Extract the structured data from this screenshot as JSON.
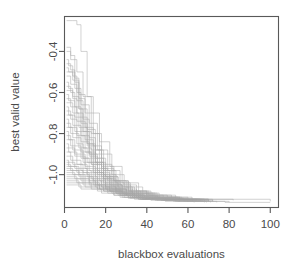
{
  "chart_data": {
    "type": "line",
    "title": "",
    "subtitle": "",
    "xlabel": "blackbox evaluations",
    "ylabel": "best valid value",
    "xlim": [
      0,
      104
    ],
    "ylim": [
      -1.16,
      -0.23
    ],
    "grid": false,
    "legend": false,
    "legend_position": "none",
    "line_color": "#a9a9a9",
    "axis_color": "#595959",
    "background_color": "#ffffff",
    "box_type": "full-rectangle",
    "step_type": "hv",
    "xticks": [
      0,
      20,
      40,
      60,
      80,
      100
    ],
    "xticklabels": [
      "0",
      "20",
      "40",
      "60",
      "80",
      "100"
    ],
    "yticks": [
      -0.4,
      -0.6,
      -0.8,
      -1.0
    ],
    "yticklabels": [
      "-0.4",
      "-0.6",
      "-0.8",
      "-1.0"
    ],
    "n_series": 40,
    "series": [
      {
        "name": "run-01",
        "x": [
          1,
          4,
          6,
          8,
          11,
          14,
          18,
          23,
          30,
          40,
          55,
          70
        ],
        "y": [
          -0.25,
          -0.25,
          -0.27,
          -0.4,
          -0.62,
          -0.8,
          -0.95,
          -1.03,
          -1.08,
          -1.11,
          -1.12,
          -1.125
        ]
      },
      {
        "name": "run-02",
        "x": [
          1,
          3,
          5,
          7,
          9,
          12,
          16,
          20,
          26,
          34,
          48,
          66
        ],
        "y": [
          -0.38,
          -0.42,
          -0.55,
          -0.68,
          -0.79,
          -0.9,
          -1.0,
          -1.06,
          -1.09,
          -1.11,
          -1.12,
          -1.13
        ]
      },
      {
        "name": "run-03",
        "x": [
          1,
          3,
          6,
          9,
          13,
          17,
          22,
          28,
          36,
          46,
          60,
          82
        ],
        "y": [
          -0.4,
          -0.44,
          -0.5,
          -0.62,
          -0.7,
          -0.84,
          -0.96,
          -1.04,
          -1.09,
          -1.11,
          -1.12,
          -1.125
        ]
      },
      {
        "name": "run-04",
        "x": [
          1,
          2,
          4,
          6,
          8,
          11,
          15,
          19,
          25,
          33,
          44,
          58,
          100
        ],
        "y": [
          -0.44,
          -0.47,
          -0.52,
          -0.6,
          -0.72,
          -0.85,
          -0.94,
          -1.02,
          -1.07,
          -1.1,
          -1.115,
          -1.12,
          -1.13
        ]
      },
      {
        "name": "run-05",
        "x": [
          1,
          3,
          5,
          8,
          12,
          16,
          21,
          27,
          35,
          45,
          62
        ],
        "y": [
          -0.46,
          -0.49,
          -0.58,
          -0.66,
          -0.75,
          -0.88,
          -0.98,
          -1.05,
          -1.09,
          -1.11,
          -1.125
        ]
      },
      {
        "name": "run-06",
        "x": [
          1,
          2,
          5,
          7,
          10,
          14,
          18,
          24,
          31,
          41,
          54,
          70
        ],
        "y": [
          -0.48,
          -0.5,
          -0.53,
          -0.63,
          -0.77,
          -0.86,
          -0.97,
          -1.03,
          -1.08,
          -1.1,
          -1.12,
          -1.13
        ]
      },
      {
        "name": "run-07",
        "x": [
          1,
          4,
          7,
          10,
          13,
          17,
          23,
          29,
          38,
          50,
          66
        ],
        "y": [
          -0.5,
          -0.54,
          -0.61,
          -0.7,
          -0.8,
          -0.9,
          -1.0,
          -1.06,
          -1.1,
          -1.12,
          -1.125
        ]
      },
      {
        "name": "run-08",
        "x": [
          1,
          3,
          6,
          9,
          12,
          15,
          20,
          26,
          34,
          44,
          57,
          72
        ],
        "y": [
          -0.52,
          -0.56,
          -0.64,
          -0.73,
          -0.82,
          -0.92,
          -1.01,
          -1.06,
          -1.09,
          -1.11,
          -1.12,
          -1.13
        ]
      },
      {
        "name": "run-09",
        "x": [
          1,
          2,
          4,
          7,
          11,
          15,
          19,
          25,
          32,
          42,
          56
        ],
        "y": [
          -0.55,
          -0.58,
          -0.62,
          -0.68,
          -0.78,
          -0.88,
          -0.98,
          -1.04,
          -1.08,
          -1.11,
          -1.12
        ]
      },
      {
        "name": "run-10",
        "x": [
          1,
          3,
          5,
          8,
          11,
          14,
          19,
          24,
          30,
          39,
          52,
          68
        ],
        "y": [
          -0.57,
          -0.6,
          -0.67,
          -0.75,
          -0.85,
          -0.94,
          -1.02,
          -1.07,
          -1.1,
          -1.115,
          -1.12,
          -1.13
        ]
      },
      {
        "name": "run-11",
        "x": [
          1,
          4,
          6,
          9,
          13,
          18,
          24,
          31,
          40,
          52,
          67
        ],
        "y": [
          -0.59,
          -0.63,
          -0.7,
          -0.79,
          -0.88,
          -0.96,
          -1.03,
          -1.08,
          -1.1,
          -1.12,
          -1.125
        ]
      },
      {
        "name": "run-12",
        "x": [
          1,
          2,
          5,
          8,
          12,
          17,
          22,
          28,
          36,
          47,
          60
        ],
        "y": [
          -0.61,
          -0.64,
          -0.72,
          -0.81,
          -0.9,
          -0.99,
          -1.05,
          -1.09,
          -1.11,
          -1.12,
          -1.13
        ]
      },
      {
        "name": "run-13",
        "x": [
          1,
          3,
          6,
          10,
          14,
          19,
          25,
          32,
          41,
          54,
          70
        ],
        "y": [
          -0.63,
          -0.67,
          -0.74,
          -0.83,
          -0.92,
          -1.0,
          -1.05,
          -1.09,
          -1.11,
          -1.12,
          -1.125
        ]
      },
      {
        "name": "run-14",
        "x": [
          1,
          4,
          7,
          11,
          15,
          20,
          26,
          33,
          43,
          56
        ],
        "y": [
          -0.65,
          -0.7,
          -0.77,
          -0.86,
          -0.94,
          -1.01,
          -1.06,
          -1.09,
          -1.11,
          -1.13
        ]
      },
      {
        "name": "run-15",
        "x": [
          1,
          2,
          5,
          9,
          13,
          18,
          23,
          30,
          39,
          50,
          64
        ],
        "y": [
          -0.67,
          -0.71,
          -0.79,
          -0.87,
          -0.95,
          -1.02,
          -1.07,
          -1.1,
          -1.115,
          -1.12,
          -1.13
        ]
      },
      {
        "name": "run-16",
        "x": [
          1,
          3,
          6,
          10,
          15,
          21,
          27,
          35,
          45,
          58
        ],
        "y": [
          -0.69,
          -0.73,
          -0.81,
          -0.89,
          -0.97,
          -1.03,
          -1.07,
          -1.1,
          -1.12,
          -1.125
        ]
      },
      {
        "name": "run-17",
        "x": [
          1,
          4,
          8,
          12,
          16,
          22,
          29,
          37,
          48,
          62
        ],
        "y": [
          -0.71,
          -0.76,
          -0.84,
          -0.91,
          -0.98,
          -1.04,
          -1.08,
          -1.1,
          -1.12,
          -1.13
        ]
      },
      {
        "name": "run-18",
        "x": [
          1,
          2,
          6,
          9,
          14,
          19,
          25,
          33,
          42,
          55,
          70
        ],
        "y": [
          -0.73,
          -0.77,
          -0.85,
          -0.92,
          -0.99,
          -1.05,
          -1.08,
          -1.11,
          -1.12,
          -1.125,
          -1.13
        ]
      },
      {
        "name": "run-19",
        "x": [
          1,
          3,
          7,
          11,
          16,
          22,
          28,
          36,
          46,
          60
        ],
        "y": [
          -0.75,
          -0.8,
          -0.87,
          -0.94,
          -1.0,
          -1.05,
          -1.09,
          -1.11,
          -1.12,
          -1.13
        ]
      },
      {
        "name": "run-20",
        "x": [
          1,
          4,
          8,
          13,
          18,
          24,
          31,
          40,
          52,
          68
        ],
        "y": [
          -0.77,
          -0.82,
          -0.89,
          -0.95,
          -1.01,
          -1.06,
          -1.09,
          -1.11,
          -1.12,
          -1.125
        ]
      },
      {
        "name": "run-21",
        "x": [
          1,
          2,
          5,
          10,
          15,
          20,
          27,
          34,
          44,
          57
        ],
        "y": [
          -0.79,
          -0.83,
          -0.9,
          -0.96,
          -1.02,
          -1.06,
          -1.09,
          -1.11,
          -1.12,
          -1.13
        ]
      },
      {
        "name": "run-22",
        "x": [
          1,
          3,
          8,
          12,
          17,
          23,
          30,
          38,
          50,
          65
        ],
        "y": [
          -0.81,
          -0.86,
          -0.92,
          -0.98,
          -1.03,
          -1.07,
          -1.1,
          -1.115,
          -1.12,
          -1.13
        ]
      },
      {
        "name": "run-23",
        "x": [
          1,
          4,
          9,
          14,
          19,
          26,
          33,
          43,
          56
        ],
        "y": [
          -0.83,
          -0.88,
          -0.94,
          -0.99,
          -1.04,
          -1.08,
          -1.1,
          -1.12,
          -1.13
        ]
      },
      {
        "name": "run-24",
        "x": [
          1,
          2,
          6,
          11,
          16,
          22,
          29,
          37,
          48,
          63
        ],
        "y": [
          -0.85,
          -0.89,
          -0.95,
          -1.0,
          -1.04,
          -1.08,
          -1.1,
          -1.12,
          -1.125,
          -1.13
        ]
      },
      {
        "name": "run-25",
        "x": [
          1,
          5,
          10,
          15,
          21,
          28,
          36,
          46,
          60
        ],
        "y": [
          -0.87,
          -0.91,
          -0.97,
          -1.01,
          -1.05,
          -1.09,
          -1.11,
          -1.12,
          -1.13
        ]
      },
      {
        "name": "run-26",
        "x": [
          1,
          3,
          8,
          13,
          18,
          25,
          32,
          41,
          54,
          70
        ],
        "y": [
          -0.89,
          -0.93,
          -0.98,
          -1.02,
          -1.06,
          -1.09,
          -1.11,
          -1.12,
          -1.125,
          -1.13
        ]
      },
      {
        "name": "run-27",
        "x": [
          1,
          4,
          9,
          14,
          20,
          27,
          35,
          45,
          58
        ],
        "y": [
          -0.91,
          -0.95,
          -0.99,
          -1.03,
          -1.07,
          -1.1,
          -1.11,
          -1.12,
          -1.13
        ]
      },
      {
        "name": "run-28",
        "x": [
          1,
          2,
          7,
          12,
          17,
          24,
          31,
          40,
          52,
          67
        ],
        "y": [
          -0.93,
          -0.96,
          -1.0,
          -1.04,
          -1.07,
          -1.1,
          -1.115,
          -1.12,
          -1.125,
          -1.13
        ]
      },
      {
        "name": "run-29",
        "x": [
          1,
          5,
          11,
          16,
          22,
          29,
          38,
          49,
          64
        ],
        "y": [
          -0.94,
          -0.97,
          -1.01,
          -1.05,
          -1.08,
          -1.1,
          -1.12,
          -1.125,
          -1.13
        ]
      },
      {
        "name": "run-30",
        "x": [
          1,
          3,
          9,
          15,
          21,
          28,
          36,
          47,
          61
        ],
        "y": [
          -0.95,
          -0.98,
          -1.02,
          -1.05,
          -1.08,
          -1.11,
          -1.12,
          -1.125,
          -1.13
        ]
      },
      {
        "name": "run-31",
        "x": [
          1,
          6,
          12,
          18,
          25,
          33,
          43,
          56,
          72
        ],
        "y": [
          -0.96,
          -0.99,
          -1.03,
          -1.06,
          -1.09,
          -1.11,
          -1.12,
          -1.125,
          -1.13
        ]
      },
      {
        "name": "run-32",
        "x": [
          1,
          4,
          10,
          16,
          23,
          31,
          41,
          53,
          69
        ],
        "y": [
          -0.97,
          -1.0,
          -1.04,
          -1.07,
          -1.09,
          -1.11,
          -1.12,
          -1.13,
          -1.135
        ]
      },
      {
        "name": "run-33",
        "x": [
          1,
          7,
          14,
          20,
          27,
          35,
          45,
          59
        ],
        "y": [
          -0.98,
          -1.01,
          -1.05,
          -1.07,
          -1.1,
          -1.115,
          -1.125,
          -1.13
        ]
      },
      {
        "name": "run-34",
        "x": [
          1,
          5,
          12,
          19,
          26,
          34,
          44,
          58,
          74
        ],
        "y": [
          -0.99,
          -1.02,
          -1.05,
          -1.08,
          -1.1,
          -1.12,
          -1.125,
          -1.13,
          -1.135
        ]
      },
      {
        "name": "run-35",
        "x": [
          1,
          8,
          15,
          22,
          30,
          39,
          50,
          66
        ],
        "y": [
          -1.0,
          -1.03,
          -1.06,
          -1.08,
          -1.1,
          -1.12,
          -1.125,
          -1.13
        ]
      },
      {
        "name": "run-36",
        "x": [
          1,
          6,
          13,
          21,
          29,
          38,
          49,
          63
        ],
        "y": [
          -1.01,
          -1.04,
          -1.07,
          -1.09,
          -1.11,
          -1.12,
          -1.13,
          -1.135
        ]
      },
      {
        "name": "run-37",
        "x": [
          1,
          9,
          17,
          25,
          33,
          43,
          55,
          71
        ],
        "y": [
          -1.02,
          -1.05,
          -1.07,
          -1.09,
          -1.11,
          -1.12,
          -1.13,
          -1.135
        ]
      },
      {
        "name": "run-38",
        "x": [
          1,
          7,
          16,
          24,
          32,
          42,
          54,
          68
        ],
        "y": [
          -1.03,
          -1.06,
          -1.08,
          -1.1,
          -1.115,
          -1.125,
          -1.13,
          -1.135
        ]
      },
      {
        "name": "run-39",
        "x": [
          1,
          10,
          19,
          28,
          37,
          48,
          62,
          80
        ],
        "y": [
          -1.04,
          -1.06,
          -1.08,
          -1.1,
          -1.12,
          -1.125,
          -1.13,
          -1.135
        ]
      },
      {
        "name": "run-40",
        "x": [
          1,
          8,
          18,
          27,
          36,
          47,
          60,
          78,
          100
        ],
        "y": [
          -1.05,
          -1.07,
          -1.09,
          -1.11,
          -1.12,
          -1.125,
          -1.13,
          -1.135,
          -1.135
        ]
      }
    ]
  }
}
